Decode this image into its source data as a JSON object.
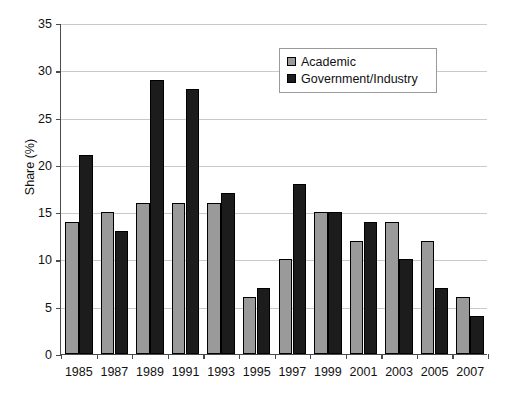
{
  "chart_data": {
    "type": "bar",
    "title": "",
    "xlabel": "",
    "ylabel": "Share (%)",
    "categories": [
      "1985",
      "1987",
      "1989",
      "1991",
      "1993",
      "1995",
      "1997",
      "1999",
      "2001",
      "2003",
      "2005",
      "2007"
    ],
    "series": [
      {
        "name": "Academic",
        "color": "#9a9a9a",
        "values": [
          14,
          15,
          16,
          16,
          16,
          6,
          10,
          15,
          12,
          14,
          12,
          6
        ]
      },
      {
        "name": "Government/Industry",
        "color": "#1c1c1c",
        "values": [
          21,
          13,
          29,
          28,
          17,
          7,
          18,
          15,
          14,
          10,
          7,
          4
        ]
      }
    ],
    "ylim": [
      0,
      35
    ],
    "yticks": [
      0,
      5,
      10,
      15,
      20,
      25,
      30,
      35
    ],
    "ytick_labels": [
      "0",
      "5",
      "10",
      "15",
      "20",
      "25",
      "30",
      "35"
    ],
    "grid": true,
    "grid_axis": "y",
    "legend_position": "top-right-inside"
  },
  "legend": {
    "entries": [
      {
        "label": "Academic",
        "swatch": "academic-swatch"
      },
      {
        "label": "Government/Industry",
        "swatch": "government-industry-swatch"
      }
    ]
  }
}
